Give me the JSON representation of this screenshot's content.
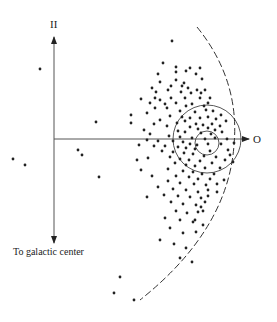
{
  "diagram": {
    "labels": {
      "top_axis": "II",
      "right_axis": "O",
      "bottom_axis": "To galactic center"
    },
    "colors": {
      "ink": "#222222",
      "axis": "#555555",
      "background": "#ffffff"
    },
    "axes": {
      "origin": [
        54,
        139
      ],
      "vertical": {
        "y_top": 36,
        "y_bottom": 244
      },
      "horizontal": {
        "x_right": 249
      }
    },
    "circles": [
      {
        "name": "outer-circle",
        "cx": 207,
        "cy": 139,
        "r": 34
      },
      {
        "name": "inner-circle",
        "cx": 207,
        "cy": 143,
        "r": 12
      }
    ],
    "dashed_arc": {
      "path": "M197,27 Q240,80 234,145 Q228,230 140,300"
    },
    "points": [
      [
        40,
        69
      ],
      [
        96,
        122
      ],
      [
        131,
        115
      ],
      [
        131,
        123
      ],
      [
        78,
        150
      ],
      [
        82,
        155
      ],
      [
        13,
        159
      ],
      [
        25,
        165
      ],
      [
        99,
        177
      ],
      [
        120,
        277
      ],
      [
        114,
        293
      ],
      [
        134,
        300
      ],
      [
        172,
        41
      ],
      [
        163,
        63
      ],
      [
        176,
        67
      ],
      [
        190,
        68
      ],
      [
        186,
        71
      ],
      [
        200,
        68
      ],
      [
        196,
        74
      ],
      [
        176,
        72
      ],
      [
        158,
        74
      ],
      [
        176,
        80
      ],
      [
        184,
        83
      ],
      [
        202,
        79
      ],
      [
        160,
        82
      ],
      [
        152,
        88
      ],
      [
        156,
        92
      ],
      [
        171,
        86
      ],
      [
        182,
        86
      ],
      [
        188,
        88
      ],
      [
        197,
        90
      ],
      [
        205,
        90
      ],
      [
        168,
        90
      ],
      [
        181,
        92
      ],
      [
        191,
        93
      ],
      [
        201,
        93
      ],
      [
        155,
        98
      ],
      [
        160,
        100
      ],
      [
        171,
        98
      ],
      [
        185,
        98
      ],
      [
        200,
        98
      ],
      [
        210,
        98
      ],
      [
        165,
        104
      ],
      [
        176,
        103
      ],
      [
        186,
        106
      ],
      [
        192,
        104
      ],
      [
        204,
        106
      ],
      [
        208,
        103
      ],
      [
        155,
        108
      ],
      [
        167,
        108
      ],
      [
        180,
        111
      ],
      [
        195,
        112
      ],
      [
        206,
        110
      ],
      [
        213,
        111
      ],
      [
        170,
        116
      ],
      [
        182,
        117
      ],
      [
        190,
        118
      ],
      [
        200,
        118
      ],
      [
        208,
        117
      ],
      [
        216,
        119
      ],
      [
        160,
        120
      ],
      [
        177,
        123
      ],
      [
        185,
        121
      ],
      [
        196,
        124
      ],
      [
        203,
        125
      ],
      [
        212,
        124
      ],
      [
        220,
        126
      ],
      [
        167,
        126
      ],
      [
        190,
        127
      ],
      [
        198,
        129
      ],
      [
        208,
        128
      ],
      [
        215,
        130
      ],
      [
        178,
        131
      ],
      [
        185,
        132
      ],
      [
        201,
        133
      ],
      [
        211,
        134
      ],
      [
        222,
        132
      ],
      [
        150,
        134
      ],
      [
        169,
        136
      ],
      [
        180,
        137
      ],
      [
        192,
        138
      ],
      [
        205,
        139
      ],
      [
        215,
        138
      ],
      [
        227,
        139
      ],
      [
        147,
        140
      ],
      [
        158,
        141
      ],
      [
        173,
        141
      ],
      [
        183,
        142
      ],
      [
        190,
        144
      ],
      [
        197,
        145
      ],
      [
        208,
        144
      ],
      [
        221,
        144
      ],
      [
        234,
        143
      ],
      [
        154,
        146
      ],
      [
        165,
        146
      ],
      [
        178,
        147
      ],
      [
        186,
        148
      ],
      [
        195,
        149
      ],
      [
        210,
        151
      ],
      [
        228,
        150
      ],
      [
        162,
        151
      ],
      [
        173,
        152
      ],
      [
        184,
        153
      ],
      [
        193,
        154
      ],
      [
        204,
        156
      ],
      [
        216,
        157
      ],
      [
        170,
        157
      ],
      [
        180,
        159
      ],
      [
        189,
        160
      ],
      [
        200,
        161
      ],
      [
        212,
        163
      ],
      [
        225,
        160
      ],
      [
        175,
        163
      ],
      [
        186,
        165
      ],
      [
        195,
        166
      ],
      [
        205,
        168
      ],
      [
        220,
        168
      ],
      [
        168,
        169
      ],
      [
        183,
        171
      ],
      [
        193,
        172
      ],
      [
        202,
        174
      ],
      [
        214,
        174
      ],
      [
        176,
        176
      ],
      [
        189,
        177
      ],
      [
        198,
        179
      ],
      [
        210,
        179
      ],
      [
        168,
        181
      ],
      [
        180,
        183
      ],
      [
        194,
        184
      ],
      [
        206,
        185
      ],
      [
        217,
        184
      ],
      [
        173,
        189
      ],
      [
        186,
        190
      ],
      [
        198,
        192
      ],
      [
        208,
        190
      ],
      [
        164,
        195
      ],
      [
        178,
        196
      ],
      [
        190,
        197
      ],
      [
        201,
        198
      ],
      [
        171,
        202
      ],
      [
        183,
        204
      ],
      [
        196,
        205
      ],
      [
        205,
        202
      ],
      [
        176,
        211
      ],
      [
        187,
        213
      ],
      [
        198,
        212
      ],
      [
        165,
        218
      ],
      [
        180,
        220
      ],
      [
        193,
        222
      ],
      [
        203,
        225
      ],
      [
        170,
        228
      ],
      [
        183,
        233
      ],
      [
        196,
        232
      ],
      [
        160,
        240
      ],
      [
        174,
        244
      ],
      [
        186,
        248
      ],
      [
        180,
        258
      ],
      [
        192,
        262
      ],
      [
        201,
        207
      ],
      [
        203,
        211
      ],
      [
        195,
        220
      ],
      [
        208,
        196
      ],
      [
        154,
        124
      ],
      [
        147,
        113
      ],
      [
        141,
        99
      ],
      [
        150,
        103
      ],
      [
        144,
        130
      ],
      [
        139,
        145
      ],
      [
        148,
        158
      ],
      [
        141,
        170
      ],
      [
        152,
        176
      ],
      [
        158,
        187
      ],
      [
        147,
        197
      ],
      [
        137,
        160
      ],
      [
        221,
        115
      ],
      [
        226,
        121
      ],
      [
        230,
        155
      ],
      [
        233,
        162
      ],
      [
        224,
        180
      ],
      [
        217,
        192
      ]
    ]
  }
}
